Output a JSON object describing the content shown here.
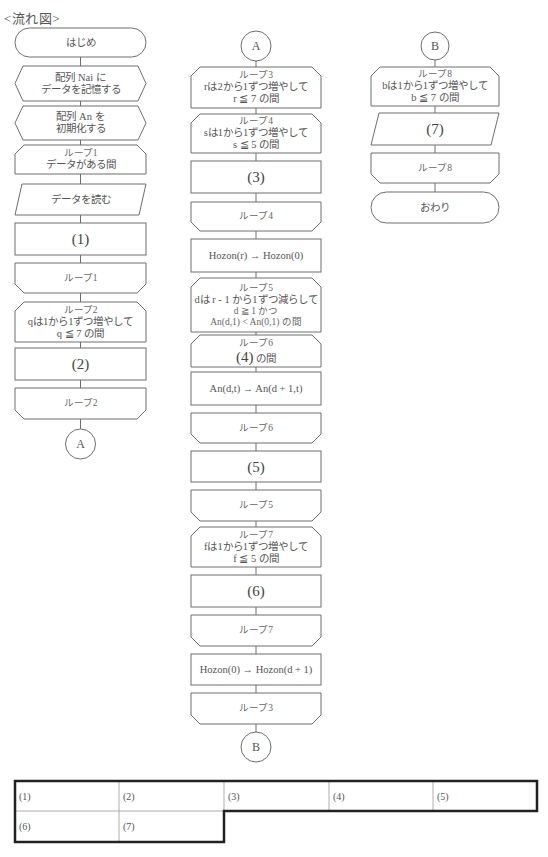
{
  "title": "<流れ図>",
  "flowchart": {
    "left": [
      {
        "type": "terminal",
        "lines": [
          "はじめ"
        ]
      },
      {
        "type": "preparation",
        "lines": [
          "配列 Nai に",
          "データを記憶する"
        ]
      },
      {
        "type": "preparation",
        "lines": [
          "配列 An を",
          "初期化する"
        ]
      },
      {
        "type": "loop_start",
        "lines": [
          "ループ1",
          "データがある間"
        ]
      },
      {
        "type": "input",
        "lines": [
          "データを読む"
        ]
      },
      {
        "type": "process",
        "lines": [
          "(1)"
        ]
      },
      {
        "type": "loop_end",
        "lines": [
          "ループ1"
        ]
      },
      {
        "type": "loop_start",
        "lines": [
          "ループ2",
          "qは1から1ずつ増やして",
          "q ≦ 7 の間"
        ]
      },
      {
        "type": "process",
        "lines": [
          "(2)"
        ]
      },
      {
        "type": "loop_end",
        "lines": [
          "ループ2"
        ]
      },
      {
        "type": "connector",
        "lines": [
          "A"
        ]
      }
    ],
    "middle": [
      {
        "type": "connector",
        "lines": [
          "A"
        ]
      },
      {
        "type": "loop_start",
        "lines": [
          "ループ3",
          "rは2から1ずつ増やして",
          "r ≦ 7 の間"
        ]
      },
      {
        "type": "loop_start",
        "lines": [
          "ループ4",
          "sは1から1ずつ増やして",
          "s ≦ 5 の間"
        ]
      },
      {
        "type": "process",
        "lines": [
          "(3)"
        ]
      },
      {
        "type": "loop_end",
        "lines": [
          "ループ4"
        ]
      },
      {
        "type": "process",
        "lines": [
          "Hozon(r) → Hozon(0)"
        ]
      },
      {
        "type": "loop_start",
        "lines": [
          "ループ5",
          "dは r - 1 から1ずつ減らして",
          "d ≧ 1 かつ",
          "An(d,1) < An(0,1) の間"
        ]
      },
      {
        "type": "loop_start",
        "lines": [
          "ループ6",
          "(4)",
          " の間"
        ]
      },
      {
        "type": "process",
        "lines": [
          "An(d,t) → An(d + 1,t)"
        ]
      },
      {
        "type": "loop_end",
        "lines": [
          "ループ6"
        ]
      },
      {
        "type": "process",
        "lines": [
          "(5)"
        ]
      },
      {
        "type": "loop_end",
        "lines": [
          "ループ5"
        ]
      },
      {
        "type": "loop_start",
        "lines": [
          "ループ7",
          "fは1から1ずつ増やして",
          "f ≦ 5 の間"
        ]
      },
      {
        "type": "process",
        "lines": [
          "(6)"
        ]
      },
      {
        "type": "loop_end",
        "lines": [
          "ループ7"
        ]
      },
      {
        "type": "process",
        "lines": [
          "Hozon(0) → Hozon(d + 1)"
        ]
      },
      {
        "type": "loop_end",
        "lines": [
          "ループ3"
        ]
      },
      {
        "type": "connector",
        "lines": [
          "B"
        ]
      }
    ],
    "right": [
      {
        "type": "connector",
        "lines": [
          "B"
        ]
      },
      {
        "type": "loop_start",
        "lines": [
          "ループ8",
          "bは1から1ずつ増やして",
          "b ≦ 7 の間"
        ]
      },
      {
        "type": "input",
        "lines": [
          "(7)"
        ]
      },
      {
        "type": "loop_end",
        "lines": [
          "ループ8"
        ]
      },
      {
        "type": "terminal",
        "lines": [
          "おわり"
        ]
      }
    ]
  },
  "answer_table": {
    "row1": [
      "(1)",
      "(2)",
      "(3)",
      "(4)",
      "(5)"
    ],
    "row2": [
      "(6)",
      "(7)"
    ]
  }
}
